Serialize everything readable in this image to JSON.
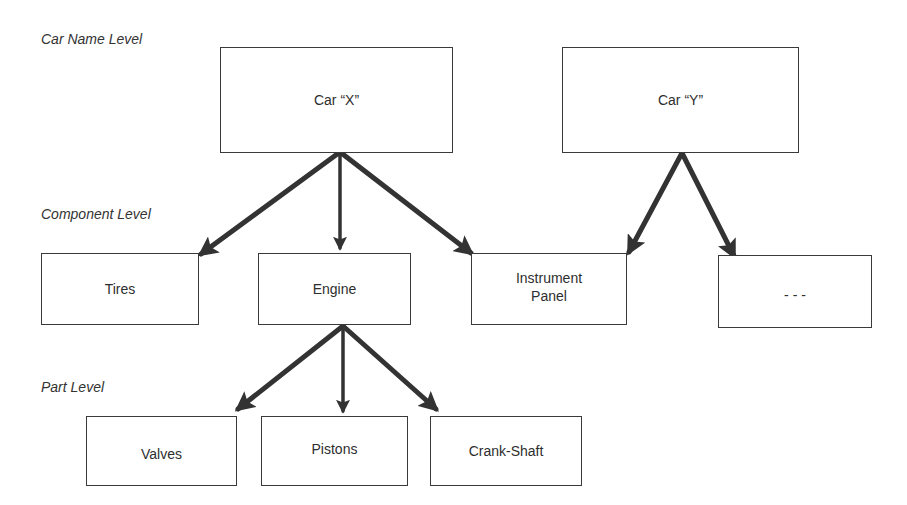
{
  "levels": {
    "car_name": "Car Name Level",
    "component": "Component Level",
    "part": "Part Level"
  },
  "nodes": {
    "car_x": "Car “X”",
    "car_y": "Car “Y”",
    "tires": "Tires",
    "engine": "Engine",
    "instrument_panel_line1": "Instrument",
    "instrument_panel_line2": "Panel",
    "ellipsis": "- - -",
    "valves": "Valves",
    "pistons": "Pistons",
    "crank_shaft": "Crank-Shaft"
  },
  "edges": [
    {
      "from": "Car “X”",
      "to": "Tires"
    },
    {
      "from": "Car “X”",
      "to": "Engine"
    },
    {
      "from": "Car “X”",
      "to": "Instrument Panel"
    },
    {
      "from": "Car “Y”",
      "to": "Instrument Panel"
    },
    {
      "from": "Car “Y”",
      "to": "- - -"
    },
    {
      "from": "Engine",
      "to": "Valves"
    },
    {
      "from": "Engine",
      "to": "Pistons"
    },
    {
      "from": "Engine",
      "to": "Crank-Shaft"
    }
  ],
  "colors": {
    "line": "#3a3a3a",
    "arrow": "#333333",
    "text": "#2e2e2e"
  }
}
